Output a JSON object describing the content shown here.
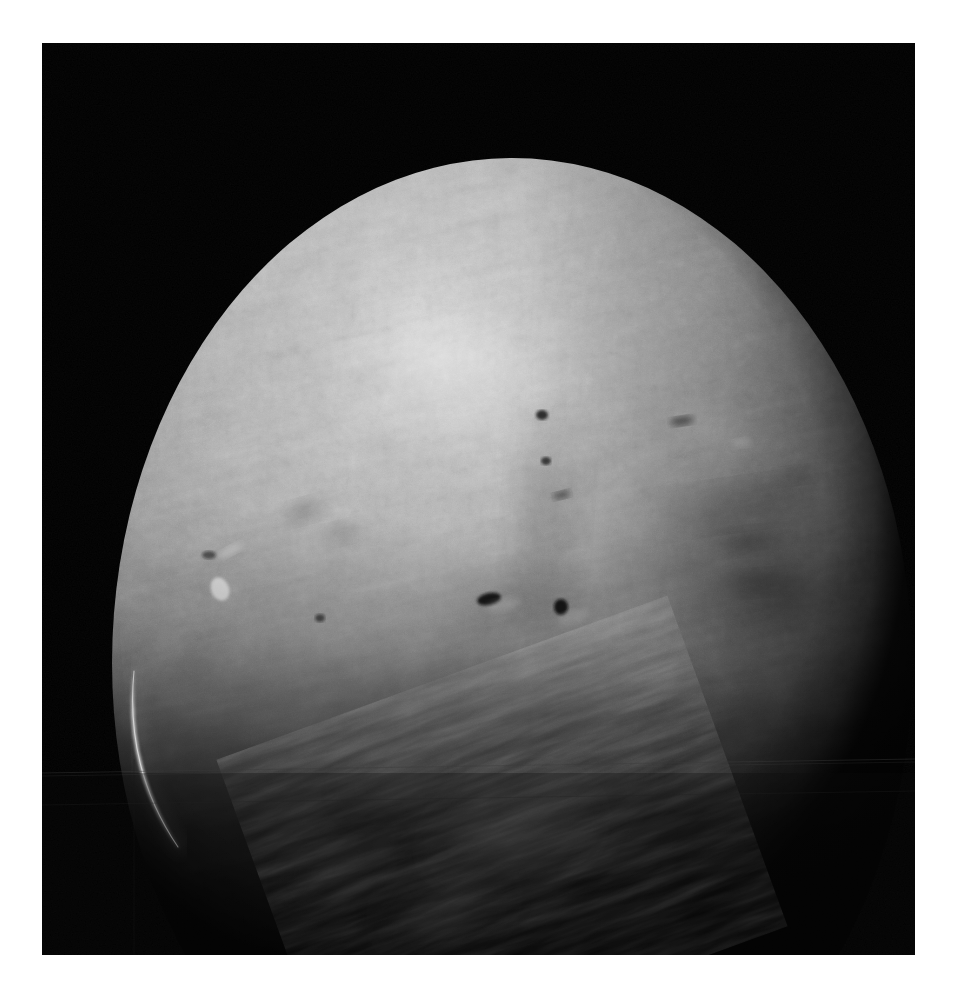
{
  "image": {
    "kind": "spacecraft-planetary-photograph",
    "caption": "",
    "page_background_color": "#ffffff",
    "frame": {
      "left": 42,
      "top": 43,
      "width": 873,
      "height": 912,
      "background_color": "#000000"
    }
  },
  "scene": {
    "background_sky_color": "#020202",
    "body_name": "planetary-disc",
    "disc": {
      "center_x": 470,
      "center_y": 620,
      "radius_x": 400,
      "radius_y": 505,
      "visible_portion": "upper-illuminated-hemisphere"
    },
    "illumination": {
      "direction": "upper-left",
      "subsolar_x": 410,
      "subsolar_y": 320,
      "highlight_color": "#d2d2d2",
      "midtone_color": "#909090",
      "shadow_color": "#0a0a0a",
      "terminator_description": "dark limb shading toward lower-right and bottom"
    },
    "limb_arc": {
      "description": "thin bright atmospheric crescent on lower-left limb",
      "color": "#cfcfcf",
      "x_start": 96,
      "y_start": 640,
      "x_end": 140,
      "y_end": 800
    },
    "seams": [
      {
        "name": "horizontal-stitch-seam-upper",
        "y": 768,
        "tilt_deg": -0.5,
        "color": "#262626"
      },
      {
        "name": "horizontal-stitch-seam-lower",
        "y": 806,
        "tilt_deg": -0.4,
        "color": "#1c1c1c"
      },
      {
        "name": "vertical-stitch-seam-left",
        "x": 134,
        "color": "#1a1a1a"
      }
    ],
    "surface_features": [
      {
        "name": "bright-highland-highlight",
        "cx": 415,
        "cy": 330,
        "rx": 130,
        "ry": 80,
        "tone": "#cfcfcf"
      },
      {
        "name": "crater-dark-spot-center",
        "cx": 447,
        "cy": 556,
        "rx": 11,
        "ry": 6,
        "tone": "#141414"
      },
      {
        "name": "crater-dark-spot-center-right",
        "cx": 519,
        "cy": 565,
        "rx": 7,
        "ry": 7,
        "tone": "#101010"
      },
      {
        "name": "crater-dark-spot-upper-center",
        "cx": 500,
        "cy": 374,
        "rx": 6,
        "ry": 5,
        "tone": "#171717"
      },
      {
        "name": "crater-dark-spot-upper-center-b",
        "cx": 505,
        "cy": 418,
        "rx": 5,
        "ry": 4,
        "tone": "#1a1a1a"
      },
      {
        "name": "bright-cloud-spot-left",
        "cx": 178,
        "cy": 545,
        "rx": 9,
        "ry": 11,
        "tone": "#e0e0e0"
      },
      {
        "name": "bright-cloud-streak-left",
        "cx": 185,
        "cy": 508,
        "rx": 13,
        "ry": 5,
        "tone": "#bdbdbd"
      },
      {
        "name": "crater-field-right",
        "cx": 700,
        "cy": 520,
        "rx": 110,
        "ry": 90,
        "tone": "#5a5a5a"
      },
      {
        "name": "dark-ridge-band-right",
        "cx": 690,
        "cy": 470,
        "rx": 90,
        "ry": 20,
        "tone": "#3a3a3a"
      },
      {
        "name": "crater-basin-upper-right",
        "cx": 688,
        "cy": 396,
        "rx": 18,
        "ry": 8,
        "tone": "#707070"
      },
      {
        "name": "dusty-plain-lower-center",
        "cx": 470,
        "cy": 700,
        "rx": 190,
        "ry": 120,
        "tone": "#4a4a4a"
      },
      {
        "name": "cloud-patch-terminator-center",
        "cx": 470,
        "cy": 800,
        "rx": 110,
        "ry": 70,
        "tone": "#3c3c3c"
      },
      {
        "name": "cloud-patch-terminator-lower",
        "cx": 400,
        "cy": 870,
        "rx": 80,
        "ry": 55,
        "tone": "#2a2a2a"
      },
      {
        "name": "cloud-wisp-lower-left",
        "cx": 300,
        "cy": 830,
        "rx": 70,
        "ry": 45,
        "tone": "#242424"
      }
    ]
  }
}
